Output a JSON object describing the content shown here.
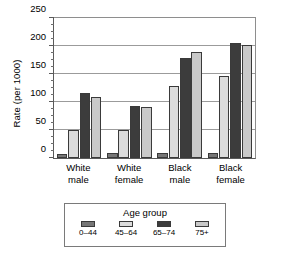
{
  "chart_data": {
    "type": "bar",
    "title": "",
    "xlabel": "",
    "ylabel": "Rate (per 1000)",
    "ylim": [
      0,
      250
    ],
    "ytick_labels": [
      "250",
      "200",
      "150",
      "100",
      "50",
      "0"
    ],
    "ytick_values": [
      250,
      200,
      150,
      100,
      50,
      0
    ],
    "minor_tick_interval": 12.5,
    "grid": true,
    "grid_axis": "y",
    "legend_title": "Age group",
    "legend_position": "below",
    "categories": [
      "White male",
      "White female",
      "Black male",
      "Black female"
    ],
    "category_lines": [
      [
        "White",
        "male"
      ],
      [
        "White",
        "female"
      ],
      [
        "Black",
        "male"
      ],
      [
        "Black",
        "female"
      ]
    ],
    "series": [
      {
        "name": "0–44",
        "color": "#767676",
        "values": [
          7,
          8,
          8,
          8
        ]
      },
      {
        "name": "45–64",
        "color": "#dcdcdc",
        "values": [
          50,
          50,
          127,
          145
        ]
      },
      {
        "name": "65–74",
        "color": "#3c3c3c",
        "values": [
          115,
          92,
          176,
          203
        ]
      },
      {
        "name": "75+",
        "color": "#c9c9c9",
        "values": [
          107,
          90,
          187,
          199
        ]
      }
    ]
  }
}
